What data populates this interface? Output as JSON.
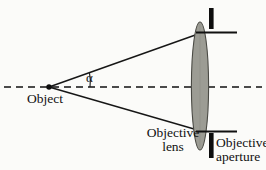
{
  "figure": {
    "background_color": "#fbfbf9",
    "ink_color": "#111111",
    "lens_fill_color": "#9c9c94",
    "lens_stroke_color": "#3a3a36",
    "aperture_color": "#0d0d0d"
  },
  "labels": {
    "object": "Object",
    "alpha": "α",
    "objective_lens": "Objective\nlens",
    "objective_aperture": "Objective\naperture"
  },
  "geometry": {
    "optical_axis": {
      "name": "optical-axis",
      "style": "dashed",
      "y": 87,
      "x_start": 4,
      "x_end": 262
    },
    "object_point": {
      "x": 49,
      "y": 87,
      "radius": 2.6
    },
    "upper_ray": {
      "x1": 49,
      "y1": 87,
      "x2": 200,
      "y2": 33
    },
    "lower_ray": {
      "x1": 49,
      "y1": 87,
      "x2": 200,
      "y2": 131
    },
    "lens": {
      "cx": 200,
      "cy": 86,
      "rx": 8.5,
      "ry": 64
    },
    "upper_aperture_bar": {
      "x": 209,
      "y": 8,
      "width": 4.5,
      "height": 21
    },
    "lower_aperture_bar": {
      "x": 209,
      "y": 133,
      "width": 4.5,
      "height": 25
    },
    "upper_aperture_edge": {
      "x1": 196,
      "y1": 32.5,
      "x2": 237,
      "y2": 32.5
    },
    "lower_aperture_edge": {
      "x1": 196,
      "y1": 131.5,
      "x2": 237,
      "y2": 131.5
    },
    "angle_arc": {
      "cx": 49,
      "cy": 87,
      "radius": 41
    }
  }
}
